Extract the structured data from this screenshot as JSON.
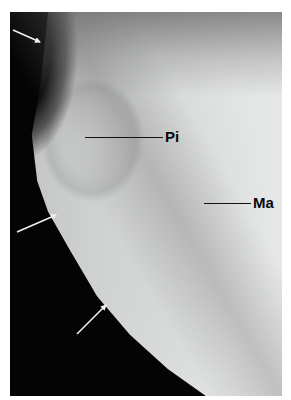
{
  "figure": {
    "labels": [
      {
        "text": "Pi",
        "leader_start": [
          85,
          137
        ],
        "leader_end": [
          163,
          137
        ],
        "text_pos": [
          165,
          129
        ]
      },
      {
        "text": "Ma",
        "leader_start": [
          204,
          203
        ],
        "leader_end": [
          251,
          203
        ],
        "text_pos": [
          253,
          195
        ]
      }
    ],
    "arrows": [
      {
        "from": [
          13,
          30
        ],
        "to": [
          41,
          43
        ],
        "color": "#f0f0f0"
      },
      {
        "from": [
          17,
          232
        ],
        "to": [
          57,
          215
        ],
        "color": "#f0f0f0"
      },
      {
        "from": [
          77,
          334
        ],
        "to": [
          107,
          304
        ],
        "color": "#f0f0f0"
      }
    ],
    "colors": {
      "background_dark": "#040404",
      "tissue_light": "#e2e4e3",
      "tissue_mid": "#c4c6c5",
      "label_text": "#0a0a0a",
      "page_background": "#ffffff"
    }
  }
}
